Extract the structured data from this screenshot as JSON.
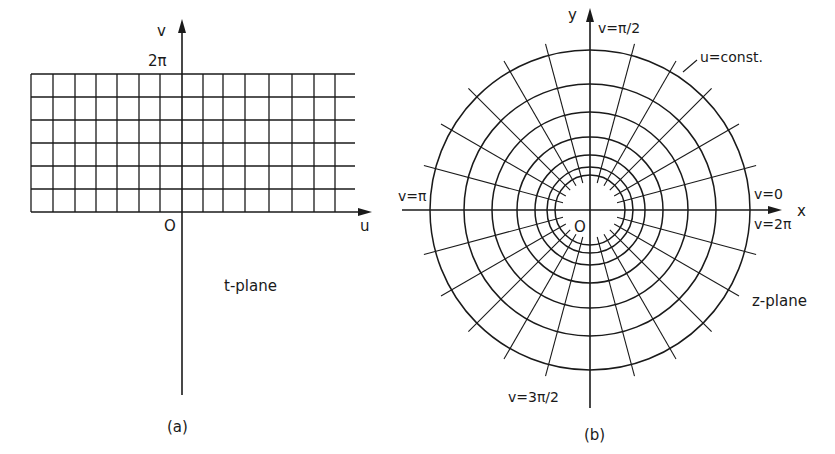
{
  "panel_a": {
    "caption": "(a)",
    "plane_label": "t-plane",
    "axis_x_label": "u",
    "axis_y_label": "v",
    "origin_label": "O",
    "top_tick_label": "2π",
    "grid": {
      "x_left": 31,
      "x_right": 355,
      "y_top": 74,
      "y_bottom": 212,
      "vertical_lines_x": [
        31,
        53,
        75,
        96,
        117,
        139,
        160,
        182,
        203,
        223,
        245,
        269,
        292,
        314,
        335
      ],
      "horizontal_lines_y": [
        74,
        97,
        120,
        143,
        166,
        189,
        212
      ]
    },
    "axes": {
      "origin": [
        182,
        212
      ],
      "x_end": 372,
      "y_top": 19,
      "y_bottom": 395
    }
  },
  "panel_b": {
    "caption": "(b)",
    "plane_label": "z-plane",
    "axis_x_label": "x",
    "axis_y_label": "y",
    "origin_label": "O",
    "labels": {
      "v_pi_over_2": "v=π/2",
      "v_pi": "v=π",
      "v_0": "v=0",
      "v_2pi": "v=2π",
      "v_3pi_over_2": "v=3π/2",
      "u_const": "u=const."
    },
    "polar": {
      "center": [
        590,
        210
      ],
      "circle_radii": [
        35,
        43,
        55,
        73,
        98,
        126,
        160
      ],
      "spoke_angle_step_deg": 15,
      "spoke_inner_radius": 28,
      "spoke_outer_radius": 172
    },
    "axes": {
      "x_start": 402,
      "x_end": 782,
      "y_top": 8,
      "y_bottom": 408
    }
  }
}
